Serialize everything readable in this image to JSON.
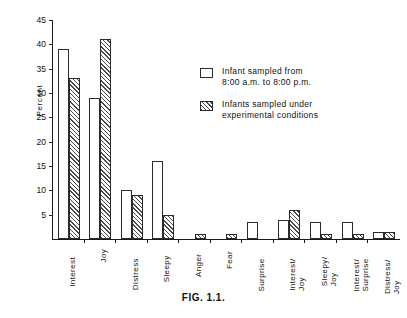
{
  "figure": {
    "caption": "FIG. 1.1."
  },
  "legend": {
    "position": "inside-top-right",
    "entries": [
      {
        "swatch": "open-box",
        "label": "Infant sampled from\n8:00 a.m. to 8:00 p.m."
      },
      {
        "swatch": "hatched-box",
        "label": "Infants sampled under\nexperimental conditions"
      }
    ]
  },
  "chart_data": {
    "type": "bar",
    "title": "",
    "xlabel": "",
    "ylabel": "Percent",
    "ylim": [
      0,
      45
    ],
    "yticks": [
      5,
      10,
      15,
      20,
      25,
      30,
      35,
      40,
      45
    ],
    "grid": false,
    "categories": [
      "Interest",
      "Joy",
      "Distress",
      "Sleepy",
      "Anger",
      "Fear",
      "Surprise",
      "Interest/\nJoy",
      "Sleepy/\nJoy",
      "Interest/\nSurprise",
      "Distress/\nJoy"
    ],
    "series": [
      {
        "name": "Infant sampled from 8:00 a.m. to 8:00 p.m.",
        "style": "open",
        "values": [
          39,
          29,
          10,
          16,
          0,
          0,
          3.5,
          4,
          3.5,
          3.5,
          1.5
        ]
      },
      {
        "name": "Infants sampled under experimental conditions",
        "style": "hatched",
        "values": [
          33,
          41,
          9,
          5,
          1,
          1,
          0,
          6,
          1,
          1,
          1.5
        ]
      }
    ]
  }
}
